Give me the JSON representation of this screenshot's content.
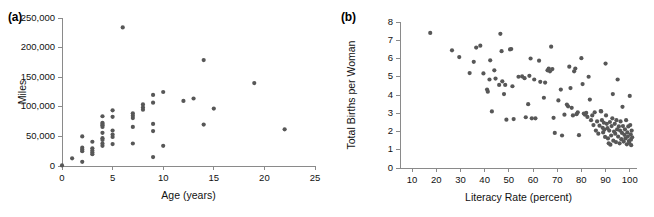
{
  "figure": {
    "background": "#ffffff",
    "dot_color": "#575757",
    "axis_color": "#8a8a8a"
  },
  "panels": [
    {
      "tag": "(a)"
    },
    {
      "tag": "(b)"
    }
  ],
  "chart_data": [
    {
      "type": "scatter",
      "panel": "(a)",
      "title": "",
      "xlabel": "Age (years)",
      "ylabel": "Miles",
      "xlim": [
        0,
        25
      ],
      "ylim": [
        0,
        250000
      ],
      "xticks": [
        0,
        5,
        10,
        15,
        20,
        25
      ],
      "xticklabels": [
        "0",
        "5",
        "10",
        "15",
        "20",
        "25"
      ],
      "yticks": [
        0,
        50000,
        100000,
        150000,
        200000,
        250000
      ],
      "yticklabels": [
        "0",
        "50,000",
        "100,000",
        "150,000",
        "200,000",
        "250,000"
      ],
      "grid": false,
      "legend": null,
      "points": [
        [
          0.0,
          1000
        ],
        [
          1.0,
          13000
        ],
        [
          2.0,
          50000
        ],
        [
          2.0,
          31000
        ],
        [
          2.0,
          28000
        ],
        [
          2.0,
          25000
        ],
        [
          2.0,
          7000
        ],
        [
          3.0,
          41000
        ],
        [
          3.0,
          30000
        ],
        [
          3.0,
          26000
        ],
        [
          3.0,
          23000
        ],
        [
          3.0,
          20000
        ],
        [
          4.0,
          84000
        ],
        [
          4.0,
          73000
        ],
        [
          4.0,
          71000
        ],
        [
          4.0,
          69000
        ],
        [
          4.0,
          66000
        ],
        [
          4.0,
          56000
        ],
        [
          4.0,
          47000
        ],
        [
          4.0,
          44000
        ],
        [
          4.0,
          38000
        ],
        [
          4.0,
          34000
        ],
        [
          5.0,
          94000
        ],
        [
          5.0,
          83000
        ],
        [
          5.0,
          60000
        ],
        [
          5.0,
          53000
        ],
        [
          5.0,
          49000
        ],
        [
          5.0,
          37000
        ],
        [
          6.0,
          234000
        ],
        [
          7.0,
          89000
        ],
        [
          7.0,
          85000
        ],
        [
          7.0,
          81000
        ],
        [
          7.0,
          66000
        ],
        [
          7.0,
          38000
        ],
        [
          8.0,
          104000
        ],
        [
          8.0,
          99000
        ],
        [
          8.0,
          95000
        ],
        [
          9.0,
          120000
        ],
        [
          9.0,
          107000
        ],
        [
          9.0,
          71000
        ],
        [
          9.0,
          59000
        ],
        [
          9.0,
          15000
        ],
        [
          10.0,
          125000
        ],
        [
          10.0,
          34000
        ],
        [
          12.0,
          110000
        ],
        [
          13.0,
          114000
        ],
        [
          14.0,
          179000
        ],
        [
          14.0,
          70000
        ],
        [
          15.0,
          97000
        ],
        [
          19.0,
          140000
        ],
        [
          22.0,
          62000
        ]
      ]
    },
    {
      "type": "scatter",
      "panel": "(b)",
      "title": "",
      "xlabel": "Literacy Rate (percent)",
      "ylabel": "Total Births per Woman",
      "xlim": [
        5,
        103
      ],
      "ylim": [
        0,
        8
      ],
      "xticks": [
        10,
        20,
        30,
        40,
        50,
        60,
        70,
        80,
        90,
        100
      ],
      "xticklabels": [
        "10",
        "20",
        "30",
        "40",
        "50",
        "60",
        "70",
        "80",
        "90",
        "100"
      ],
      "yticks": [
        0,
        1,
        2,
        3,
        4,
        5,
        6,
        7,
        8
      ],
      "yticklabels": [
        "0",
        "1",
        "2",
        "3",
        "4",
        "5",
        "6",
        "7",
        "8"
      ],
      "grid": false,
      "legend": null,
      "points": [
        [
          17.5,
          7.4
        ],
        [
          26.5,
          6.45
        ],
        [
          29.5,
          6.08
        ],
        [
          33.8,
          5.2
        ],
        [
          35.5,
          5.82
        ],
        [
          36.5,
          6.6
        ],
        [
          38.2,
          6.7
        ],
        [
          39.5,
          5.18
        ],
        [
          41.0,
          4.3
        ],
        [
          41.3,
          4.18
        ],
        [
          42.0,
          4.85
        ],
        [
          42.3,
          5.9
        ],
        [
          43.0,
          3.1
        ],
        [
          44.0,
          5.35
        ],
        [
          44.5,
          4.9
        ],
        [
          46.0,
          4.55
        ],
        [
          46.5,
          7.35
        ],
        [
          47.0,
          6.4
        ],
        [
          47.3,
          4.75
        ],
        [
          48.0,
          4.05
        ],
        [
          48.5,
          4.55
        ],
        [
          49.0,
          2.65
        ],
        [
          50.5,
          6.5
        ],
        [
          51.0,
          6.52
        ],
        [
          51.5,
          4.48
        ],
        [
          52.0,
          2.68
        ],
        [
          54.0,
          5.0
        ],
        [
          55.5,
          5.02
        ],
        [
          56.5,
          4.92
        ],
        [
          57.0,
          2.78
        ],
        [
          58.0,
          3.5
        ],
        [
          58.5,
          5.05
        ],
        [
          59.0,
          6.0
        ],
        [
          59.5,
          2.72
        ],
        [
          60.5,
          4.85
        ],
        [
          61.0,
          2.72
        ],
        [
          62.5,
          5.88
        ],
        [
          63.0,
          4.72
        ],
        [
          64.5,
          3.85
        ],
        [
          65.0,
          4.68
        ],
        [
          66.0,
          5.35
        ],
        [
          66.5,
          5.45
        ],
        [
          67.0,
          5.3
        ],
        [
          67.5,
          6.65
        ],
        [
          68.0,
          5.42
        ],
        [
          68.5,
          2.75
        ],
        [
          69.0,
          1.92
        ],
        [
          70.5,
          3.7
        ],
        [
          71.5,
          4.3
        ],
        [
          72.0,
          1.78
        ],
        [
          73.0,
          2.92
        ],
        [
          74.0,
          3.48
        ],
        [
          74.5,
          3.38
        ],
        [
          75.0,
          5.55
        ],
        [
          75.5,
          4.38
        ],
        [
          76.0,
          3.3
        ],
        [
          76.5,
          2.88
        ],
        [
          77.0,
          5.3
        ],
        [
          77.5,
          5.45
        ],
        [
          78.0,
          2.95
        ],
        [
          78.5,
          3.05
        ],
        [
          79.0,
          1.8
        ],
        [
          80.0,
          6.02
        ],
        [
          80.5,
          4.6
        ],
        [
          81.0,
          2.98
        ],
        [
          81.5,
          2.92
        ],
        [
          82.0,
          3.02
        ],
        [
          82.5,
          2.8
        ],
        [
          83.0,
          5.0
        ],
        [
          83.5,
          3.75
        ],
        [
          84.0,
          2.62
        ],
        [
          84.5,
          2.88
        ],
        [
          85.0,
          2.35
        ],
        [
          85.5,
          3.05
        ],
        [
          86.0,
          2.05
        ],
        [
          86.5,
          2.55
        ],
        [
          87.0,
          1.88
        ],
        [
          87.5,
          2.32
        ],
        [
          88.0,
          3.12
        ],
        [
          88.2,
          3.1
        ],
        [
          88.5,
          2.62
        ],
        [
          88.8,
          2.2
        ],
        [
          89.0,
          1.95
        ],
        [
          89.3,
          2.48
        ],
        [
          89.5,
          2.1
        ],
        [
          89.8,
          1.7
        ],
        [
          90.0,
          5.72
        ],
        [
          90.2,
          2.88
        ],
        [
          90.5,
          2.42
        ],
        [
          90.8,
          2.18
        ],
        [
          91.0,
          1.62
        ],
        [
          91.3,
          1.35
        ],
        [
          91.5,
          2.05
        ],
        [
          91.8,
          2.52
        ],
        [
          92.0,
          1.28
        ],
        [
          92.3,
          1.78
        ],
        [
          92.5,
          2.3
        ],
        [
          92.8,
          2.72
        ],
        [
          93.0,
          4.05
        ],
        [
          93.2,
          1.5
        ],
        [
          93.5,
          2.0
        ],
        [
          93.8,
          2.42
        ],
        [
          94.0,
          1.88
        ],
        [
          94.3,
          1.42
        ],
        [
          94.5,
          2.62
        ],
        [
          94.8,
          2.12
        ],
        [
          95.0,
          4.85
        ],
        [
          95.2,
          1.72
        ],
        [
          95.5,
          2.28
        ],
        [
          95.8,
          1.35
        ],
        [
          96.0,
          2.05
        ],
        [
          96.2,
          2.55
        ],
        [
          96.5,
          1.58
        ],
        [
          96.8,
          1.92
        ],
        [
          97.0,
          3.35
        ],
        [
          97.2,
          2.3
        ],
        [
          97.5,
          1.45
        ],
        [
          97.8,
          1.82
        ],
        [
          98.0,
          2.12
        ],
        [
          98.2,
          1.62
        ],
        [
          98.5,
          2.62
        ],
        [
          98.8,
          1.3
        ],
        [
          99.0,
          1.95
        ],
        [
          99.2,
          1.72
        ],
        [
          99.4,
          2.28
        ],
        [
          99.6,
          1.48
        ],
        [
          99.8,
          1.38
        ],
        [
          100.0,
          3.95
        ],
        [
          100.2,
          2.35
        ],
        [
          100.4,
          1.85
        ],
        [
          100.5,
          1.55
        ],
        [
          100.6,
          1.25
        ],
        [
          100.8,
          2.05
        ],
        [
          101.0,
          1.68
        ]
      ]
    }
  ]
}
